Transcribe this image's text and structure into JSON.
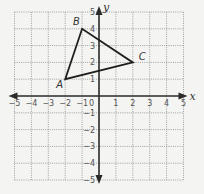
{
  "diagram": {
    "type": "coordinate-plane",
    "x_axis": {
      "label": "x",
      "min": -5,
      "max": 5,
      "ticks": [
        -5,
        -4,
        -3,
        -2,
        -1,
        1,
        2,
        3,
        4,
        5
      ]
    },
    "y_axis": {
      "label": "y",
      "min": -5,
      "max": 5,
      "ticks": [
        -5,
        -4,
        -3,
        -2,
        -1,
        1,
        2,
        3,
        4,
        5
      ]
    },
    "origin_label": "0",
    "grid": true,
    "shape": {
      "type": "triangle",
      "vertices": [
        {
          "name": "A",
          "x": -2,
          "y": 1
        },
        {
          "name": "B",
          "x": -1,
          "y": 4
        },
        {
          "name": "C",
          "x": 2,
          "y": 2
        }
      ]
    },
    "colors": {
      "background": "#f4f4f2",
      "grid": "#8a8a8a",
      "axis": "#2a2a2a",
      "shape": "#1e1e1e"
    }
  }
}
